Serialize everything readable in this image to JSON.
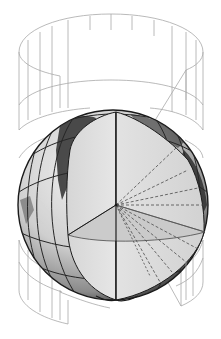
{
  "figure": {
    "caption_fragment": "· · ·   ·     ·",
    "elements": {
      "cylinder": "wireframe-cylinder",
      "globe": "cutaway-globe",
      "wedge": "cutaway-wedge",
      "equatorial_plane": "equatorial-plane",
      "projection_rays": "projection-rays"
    },
    "colors": {
      "cylinder_line": "#a8a8a8",
      "globe_light": "#e4e4e4",
      "globe_mid": "#b9b9b9",
      "globe_dark": "#3a3a3a",
      "land": "#2f2f2f",
      "wedge_face": "#dcdcdc",
      "grid_line": "#262626",
      "background": "#ffffff"
    }
  }
}
